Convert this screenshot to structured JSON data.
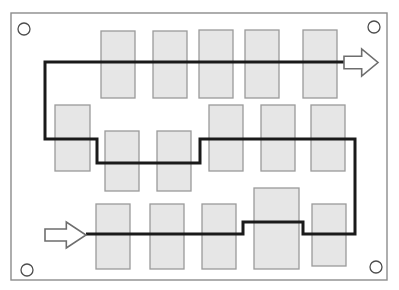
{
  "diagram": {
    "type": "schematic",
    "canvas": {
      "width": 399,
      "height": 290
    },
    "colors": {
      "background": "#ffffff",
      "board_fill": "#ffffff",
      "board_stroke": "#8c8c8c",
      "component_fill": "#e6e6e6",
      "component_stroke": "#9a9a9a",
      "trace_stroke": "#1a1a1a",
      "arrow_fill": "#ffffff",
      "arrow_stroke": "#6e6e6e",
      "hole_fill": "#ffffff",
      "hole_stroke": "#4d4d4d"
    },
    "board": {
      "name": "board-outline",
      "x": 11,
      "y": 13,
      "width": 376,
      "height": 267
    },
    "mounting_holes": [
      {
        "name": "mounting-hole-top-left",
        "cx": 24,
        "cy": 29,
        "r": 6
      },
      {
        "name": "mounting-hole-top-right",
        "cx": 374,
        "cy": 27,
        "r": 6
      },
      {
        "name": "mounting-hole-bottom-left",
        "cx": 27,
        "cy": 270,
        "r": 6
      },
      {
        "name": "mounting-hole-bottom-right",
        "cx": 376,
        "cy": 267,
        "r": 6
      }
    ],
    "components": [
      {
        "name": "component-top-1",
        "row": "top",
        "x": 101,
        "y": 31,
        "width": 34,
        "height": 67
      },
      {
        "name": "component-top-2",
        "row": "top",
        "x": 153,
        "y": 31,
        "width": 34,
        "height": 67
      },
      {
        "name": "component-top-3",
        "row": "top",
        "x": 199,
        "y": 30,
        "width": 34,
        "height": 68
      },
      {
        "name": "component-top-4",
        "row": "top",
        "x": 245,
        "y": 30,
        "width": 34,
        "height": 68
      },
      {
        "name": "component-top-5",
        "row": "top",
        "x": 303,
        "y": 30,
        "width": 34,
        "height": 68
      },
      {
        "name": "component-mid-1",
        "row": "middle",
        "x": 55,
        "y": 105,
        "width": 35,
        "height": 66
      },
      {
        "name": "component-mid-2",
        "row": "middle",
        "x": 105,
        "y": 131,
        "width": 34,
        "height": 60
      },
      {
        "name": "component-mid-3",
        "row": "middle",
        "x": 157,
        "y": 131,
        "width": 34,
        "height": 60
      },
      {
        "name": "component-mid-4",
        "row": "middle",
        "x": 209,
        "y": 105,
        "width": 34,
        "height": 66
      },
      {
        "name": "component-mid-5",
        "row": "middle",
        "x": 261,
        "y": 105,
        "width": 34,
        "height": 66
      },
      {
        "name": "component-mid-6",
        "row": "middle",
        "x": 311,
        "y": 105,
        "width": 34,
        "height": 66
      },
      {
        "name": "component-bot-1",
        "row": "bottom",
        "x": 96,
        "y": 204,
        "width": 34,
        "height": 65
      },
      {
        "name": "component-bot-2",
        "row": "bottom",
        "x": 150,
        "y": 204,
        "width": 34,
        "height": 65
      },
      {
        "name": "component-bot-3",
        "row": "bottom",
        "x": 202,
        "y": 204,
        "width": 34,
        "height": 65
      },
      {
        "name": "component-bot-4",
        "row": "bottom",
        "x": 254,
        "y": 188,
        "width": 45,
        "height": 81
      },
      {
        "name": "component-bot-5",
        "row": "bottom",
        "x": 312,
        "y": 204,
        "width": 34,
        "height": 62
      }
    ],
    "trace": {
      "name": "signal-trace",
      "stroke_width": 3,
      "points": [
        [
          86,
          234
        ],
        [
          243,
          234
        ],
        [
          243,
          222
        ],
        [
          303,
          222
        ],
        [
          303,
          234
        ],
        [
          355,
          234
        ],
        [
          355,
          139
        ],
        [
          200,
          139
        ],
        [
          200,
          163
        ],
        [
          97,
          163
        ],
        [
          97,
          139
        ],
        [
          45,
          139
        ],
        [
          45,
          62
        ],
        [
          344,
          62
        ]
      ]
    },
    "arrows": [
      {
        "name": "input-arrow",
        "direction": "right",
        "label": "signal input",
        "x": 45,
        "y": 222,
        "width": 41,
        "height": 26
      },
      {
        "name": "output-arrow",
        "direction": "right",
        "label": "signal output",
        "x": 344,
        "y": 49,
        "width": 34,
        "height": 27
      }
    ]
  }
}
